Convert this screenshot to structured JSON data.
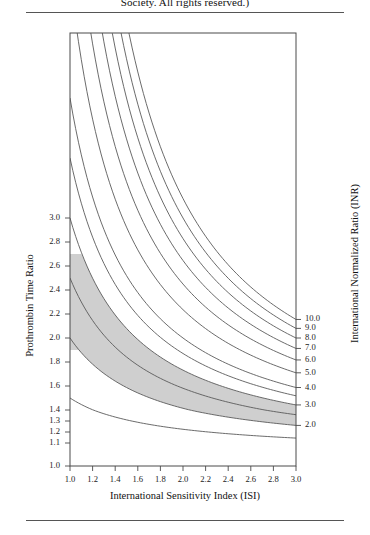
{
  "caption": {
    "top_text": "Society. All rights reserved.)"
  },
  "chart_data": {
    "type": "line",
    "title": "",
    "subtitle": "",
    "xlabel": "International Sensitivity Index (ISI)",
    "ylabel": "Prothrombin Time Ratio",
    "y2label": "International Normalized Ratio (INR)",
    "xlim": [
      1.0,
      3.0
    ],
    "ylim": [
      1.0,
      3.1
    ],
    "yscale": "linear-ptr",
    "grid": false,
    "legend": "none",
    "relation": "INR = PTR ^ ISI",
    "xticks": [
      "1.0",
      "1.2",
      "1.4",
      "1.6",
      "1.8",
      "2.0",
      "2.2",
      "2.4",
      "2.6",
      "2.8",
      "3.0"
    ],
    "xtick_values": [
      1.0,
      1.2,
      1.4,
      1.6,
      1.8,
      2.0,
      2.2,
      2.4,
      2.6,
      2.8,
      3.0
    ],
    "yticks_left": [
      "3.0",
      "2.8",
      "2.6",
      "2.4",
      "2.2",
      "2.0",
      "1.8",
      "1.6",
      "1.4",
      "1.3",
      "1.2",
      "1.1",
      "1.0"
    ],
    "ytick_left_values": [
      3.0,
      2.8,
      2.6,
      2.4,
      2.2,
      2.0,
      1.8,
      1.6,
      1.4,
      1.3,
      1.2,
      1.1,
      1.0
    ],
    "yticks_right": [
      "10.0",
      "9.0",
      "8.0",
      "7.0",
      "6.0",
      "5.0",
      "4.0",
      "3.0",
      "2.0"
    ],
    "ytick_right_values": [
      10.0,
      9.0,
      8.0,
      7.0,
      6.0,
      5.0,
      4.0,
      3.0,
      2.0
    ],
    "series": [
      {
        "name": "INR 1.5",
        "inr": 1.5,
        "ptr_at_isi_1.0": 1.5,
        "ptr_at_isi_3.0": 1.145
      },
      {
        "name": "INR 2.0",
        "inr": 2.0,
        "ptr_at_isi_1.0": 2.0,
        "ptr_at_isi_3.0": 1.26
      },
      {
        "name": "INR 2.5",
        "inr": 2.5,
        "ptr_at_isi_1.0": 2.5,
        "ptr_at_isi_3.0": 1.357
      },
      {
        "name": "INR 3.0",
        "inr": 3.0,
        "ptr_at_isi_1.0": 3.0,
        "ptr_at_isi_3.0": 1.442
      },
      {
        "name": "INR 3.5",
        "inr": 3.5,
        "ptr_at_isi_1.0": 3.5,
        "ptr_at_isi_3.0": 1.518
      },
      {
        "name": "INR 4.0",
        "inr": 4.0,
        "ptr_at_isi_1.0": 4.0,
        "ptr_at_isi_3.0": 1.587
      },
      {
        "name": "INR 5.0",
        "inr": 5.0,
        "ptr_at_isi_1.0": 5.0,
        "ptr_at_isi_3.0": 1.71
      },
      {
        "name": "INR 6.0",
        "inr": 6.0,
        "ptr_at_isi_1.0": 6.0,
        "ptr_at_isi_3.0": 1.817
      },
      {
        "name": "INR 7.0",
        "inr": 7.0,
        "ptr_at_isi_1.0": 7.0,
        "ptr_at_isi_3.0": 1.913
      },
      {
        "name": "INR 8.0",
        "inr": 8.0,
        "ptr_at_isi_1.0": 8.0,
        "ptr_at_isi_3.0": 2.0
      },
      {
        "name": "INR 9.0",
        "inr": 9.0,
        "ptr_at_isi_1.0": 9.0,
        "ptr_at_isi_3.0": 2.08
      },
      {
        "name": "INR 10.0",
        "inr": 10.0,
        "ptr_at_isi_1.0": 10.0,
        "ptr_at_isi_3.0": 2.154
      }
    ],
    "shaded_band": {
      "label": "therapeutic range",
      "inr_low": 2.0,
      "inr_high": 3.0,
      "ptr_cap_high": 2.7,
      "ptr_cap_low": 1.9,
      "color": "#cfcfcf"
    }
  }
}
